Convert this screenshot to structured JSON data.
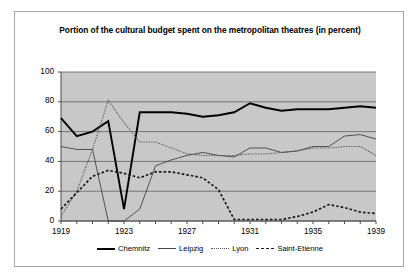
{
  "chart_data": {
    "type": "line",
    "title": "Portion of the cultural budget spent on the metropolitan theatres (in percent)",
    "xlabel": "",
    "ylabel": "",
    "xlim": [
      1919,
      1939
    ],
    "ylim": [
      0,
      100
    ],
    "grid": "horizontal",
    "legend_position": "bottom",
    "ytick_labels": [
      "0",
      "20",
      "40",
      "60",
      "80",
      "100"
    ],
    "ytick_values": [
      0,
      20,
      40,
      60,
      80,
      100
    ],
    "xtick_labels": [
      "1919",
      "1923",
      "1927",
      "1931",
      "1935",
      "1939"
    ],
    "xtick_values": [
      1919,
      1923,
      1927,
      1931,
      1935,
      1939
    ],
    "x": [
      1919,
      1920,
      1921,
      1922,
      1923,
      1924,
      1925,
      1926,
      1927,
      1928,
      1929,
      1930,
      1931,
      1932,
      1933,
      1934,
      1935,
      1936,
      1937,
      1938,
      1939
    ],
    "series": [
      {
        "name": "Chemnitz",
        "style": "solid-thick",
        "color": "#000000",
        "values": [
          69,
          57,
          60,
          67,
          8,
          73,
          73,
          73,
          72,
          70,
          71,
          73,
          79,
          76,
          74,
          75,
          75,
          75,
          76,
          77,
          76
        ]
      },
      {
        "name": "Leipzig",
        "style": "solid-thin",
        "color": "#444444",
        "values": [
          50,
          48,
          48,
          0,
          0,
          8,
          37,
          41,
          44,
          46,
          44,
          43,
          49,
          49,
          46,
          47,
          50,
          50,
          57,
          58,
          55
        ]
      },
      {
        "name": "Lyon",
        "style": "dotted",
        "color": "#555555",
        "values": [
          3,
          20,
          48,
          81,
          66,
          53,
          53,
          49,
          45,
          44,
          44,
          44,
          45,
          45,
          46,
          47,
          49,
          49,
          50,
          50,
          44
        ]
      },
      {
        "name": "Saint-Etienne",
        "style": "dashed",
        "color": "#1a1a1a",
        "values": [
          8,
          19,
          30,
          34,
          32,
          29,
          33,
          33,
          31,
          29,
          21,
          1,
          1,
          1,
          1,
          3,
          6,
          11,
          9,
          6,
          5
        ]
      }
    ]
  },
  "legend": {
    "items": [
      {
        "label": "Chemnitz"
      },
      {
        "label": "Leipzig"
      },
      {
        "label": "Lyon"
      },
      {
        "label": "Saint-Etienne"
      }
    ]
  },
  "colors": {
    "panel_background": "#c8c8c8",
    "gridline": "#6b6b6b",
    "axis": "#4d4d4d",
    "figure_border": "#a6a6a6",
    "figure_background": "#ffffff",
    "text": "#000000"
  }
}
